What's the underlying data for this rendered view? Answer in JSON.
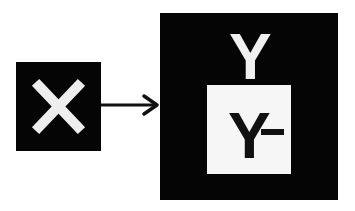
{
  "diagram": {
    "source_node": {
      "symbol": "x-mark",
      "fill": "#050505",
      "mark_color": "#eeeeee"
    },
    "edge": {
      "type": "arrow",
      "direction": "right",
      "color": "#111111"
    },
    "target_node": {
      "label": "Y",
      "fill": "#050505",
      "label_color": "#f0f0f0",
      "inner_box": {
        "label": "Y",
        "suffix": "-",
        "fill": "#f6f6f6",
        "label_color": "#111111"
      }
    }
  }
}
